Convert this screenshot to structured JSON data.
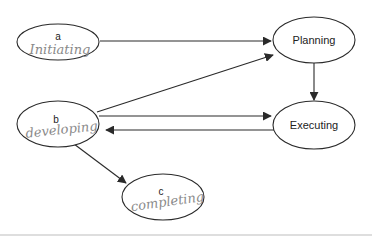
{
  "diagram": {
    "nodes": [
      {
        "id": "a",
        "label": "a",
        "annotation": "Initiating",
        "cx": 58,
        "cy": 42,
        "rx": 41,
        "ry": 18
      },
      {
        "id": "b",
        "label": "b",
        "annotation": "developing",
        "cx": 58,
        "cy": 124,
        "rx": 41,
        "ry": 23
      },
      {
        "id": "c",
        "label": "c",
        "annotation": "completing",
        "cx": 163,
        "cy": 197,
        "rx": 41,
        "ry": 23
      },
      {
        "id": "planning",
        "label": "Planning",
        "cx": 314,
        "cy": 40,
        "rx": 41,
        "ry": 23
      },
      {
        "id": "executing",
        "label": "Executing",
        "cx": 314,
        "cy": 125,
        "rx": 41,
        "ry": 24
      }
    ],
    "edges": [
      {
        "from": "a",
        "to": "planning"
      },
      {
        "from": "b",
        "to": "planning"
      },
      {
        "from": "b",
        "to": "executing"
      },
      {
        "from": "executing",
        "to": "b"
      },
      {
        "from": "planning",
        "to": "executing"
      },
      {
        "from": "b",
        "to": "c"
      }
    ],
    "colors": {
      "stroke": "#2a2a2a",
      "handwriting": "#8a8a8a",
      "rule": "#bdbdbd"
    }
  }
}
